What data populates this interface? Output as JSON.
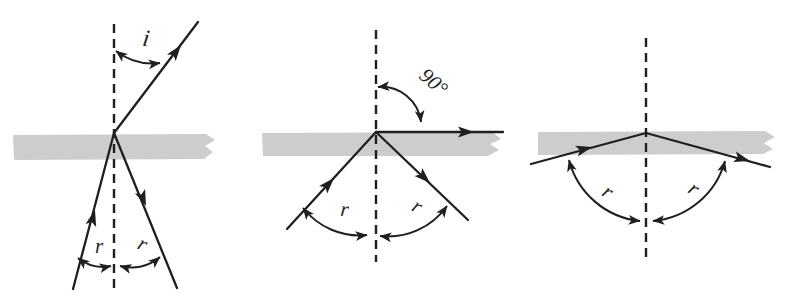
{
  "figure": {
    "colors": {
      "ink": "#1f1f1f",
      "surface_band": "#cdcdcd",
      "background": "#ffffff"
    },
    "panels": [
      {
        "name": "refraction-with-partial-internal-reflection",
        "labels": {
          "refraction_angle": "i",
          "incident_angle": "r",
          "reflected_angle": "r"
        }
      },
      {
        "name": "critical-angle",
        "labels": {
          "refraction_angle": "90°",
          "incident_angle": "r",
          "reflected_angle": "r"
        }
      },
      {
        "name": "total-internal-reflection",
        "labels": {
          "incident_angle": "r",
          "reflected_angle": "r"
        }
      }
    ]
  }
}
